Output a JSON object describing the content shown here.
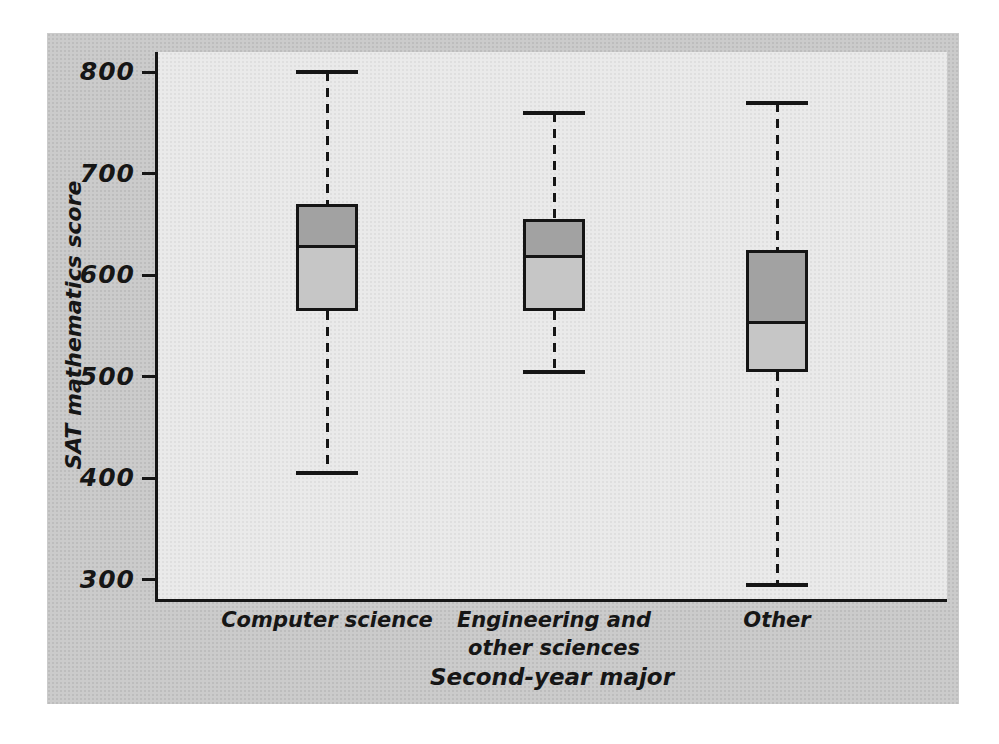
{
  "figure": {
    "background_outer": "#c9c9c9",
    "background_plot": "#e9e9e9",
    "line_color": "#151515",
    "box_upper_color": "#a2a2a2",
    "box_lower_color": "#c6c6c6"
  },
  "chart_data": {
    "type": "boxplot",
    "title": "",
    "xlabel": "Second-year major",
    "ylabel": "SAT mathematics score",
    "ylim": [
      281,
      820
    ],
    "yticks": [
      300,
      400,
      500,
      600,
      700,
      800
    ],
    "ytick_labels": [
      "300",
      "400",
      "500",
      "600",
      "700",
      "800"
    ],
    "grid": false,
    "legend": false,
    "categories": [
      "Computer science",
      "Engineering and\nother sciences",
      "Other"
    ],
    "series": [
      {
        "name": "Computer science",
        "min": 405,
        "q1": 565,
        "median": 630,
        "q3": 670,
        "max": 800
      },
      {
        "name": "Engineering and other sciences",
        "min": 505,
        "q1": 565,
        "median": 620,
        "q3": 655,
        "max": 760
      },
      {
        "name": "Other",
        "min": 295,
        "q1": 505,
        "median": 555,
        "q3": 625,
        "max": 770
      }
    ]
  }
}
